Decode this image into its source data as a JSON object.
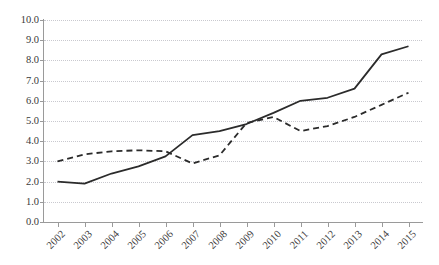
{
  "chart_data": {
    "type": "line",
    "title": "",
    "subtitle": "",
    "xlabel": "",
    "ylabel": "",
    "categories": [
      "2002",
      "2003",
      "2004",
      "2005",
      "2006",
      "2007",
      "2008",
      "2009",
      "2010",
      "2011",
      "2012",
      "2013",
      "2014",
      "2015"
    ],
    "x": [
      2002,
      2003,
      2004,
      2005,
      2006,
      2007,
      2008,
      2009,
      2010,
      2011,
      2012,
      2013,
      2014,
      2015
    ],
    "ylim": [
      0.0,
      10.0
    ],
    "ytick_labels": [
      "0.0",
      "1.0",
      "2.0",
      "3.0",
      "4.0",
      "5.0",
      "6.0",
      "7.0",
      "8.0",
      "9.0",
      "10.0"
    ],
    "ytick_values": [
      0.0,
      1.0,
      2.0,
      3.0,
      4.0,
      5.0,
      6.0,
      7.0,
      8.0,
      9.0,
      10.0
    ],
    "grid": true,
    "grid_style": "dotted",
    "legend": "none",
    "legend_position": "none",
    "annotations": [],
    "series": [
      {
        "name": "solid-series",
        "style": "solid",
        "color": "#2b2b2b",
        "values": [
          2.0,
          1.9,
          2.4,
          2.75,
          3.25,
          4.3,
          4.5,
          4.85,
          5.4,
          6.0,
          6.15,
          6.6,
          8.3,
          8.7
        ]
      },
      {
        "name": "dashed-series",
        "style": "dashed",
        "color": "#2b2b2b",
        "values": [
          3.0,
          3.35,
          3.5,
          3.55,
          3.5,
          2.9,
          3.3,
          4.9,
          5.2,
          4.5,
          4.75,
          5.2,
          5.8,
          6.4
        ]
      }
    ]
  }
}
